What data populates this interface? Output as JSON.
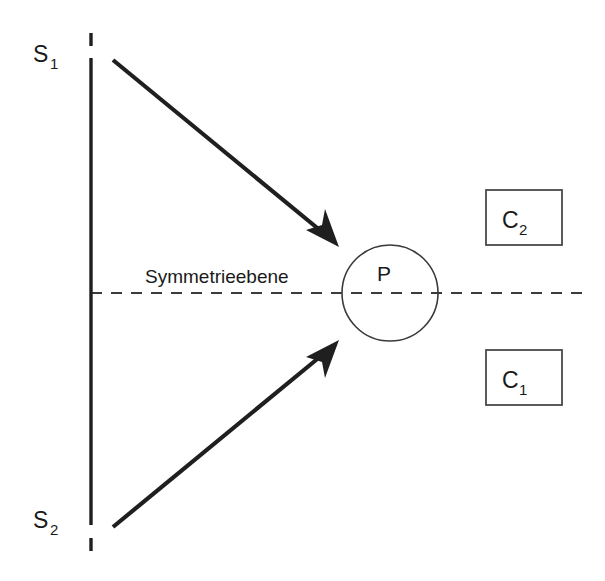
{
  "figure": {
    "background_color": "#ffffff",
    "line_color": "#1f1f1f",
    "dash_color": "#3c3c3c",
    "box_stroke_color": "#4a4a4a"
  },
  "sources": [
    {
      "id": "s1",
      "label": "S",
      "subscript": "1",
      "x": 33,
      "y": 60
    },
    {
      "id": "s2",
      "label": "S",
      "subscript": "2",
      "x": 33,
      "y": 526
    }
  ],
  "symmetry_plane": {
    "label": "Symmetrieebene",
    "y": 293,
    "x_start": 91,
    "x_end": 586,
    "style": "dashed"
  },
  "source_axis": {
    "x": 91,
    "y_start": 58,
    "y_end": 525,
    "style": "solid-with-end-ticks"
  },
  "point": {
    "label": "P",
    "cx": 390,
    "cy": 293,
    "r": 48
  },
  "beams": [
    {
      "id": "beam-upper",
      "from": "S1",
      "to": "P",
      "x1": 113,
      "y1": 60,
      "x2": 338,
      "y2": 245
    },
    {
      "id": "beam-lower",
      "from": "S2",
      "to": "P",
      "x1": 113,
      "y1": 527,
      "x2": 338,
      "y2": 343
    }
  ],
  "detectors": [
    {
      "id": "c2",
      "label": "C",
      "subscript": "2",
      "x": 486,
      "y": 190,
      "width": 76,
      "height": 55
    },
    {
      "id": "c1",
      "label": "C",
      "subscript": "1",
      "x": 486,
      "y": 350,
      "width": 76,
      "height": 55
    }
  ]
}
